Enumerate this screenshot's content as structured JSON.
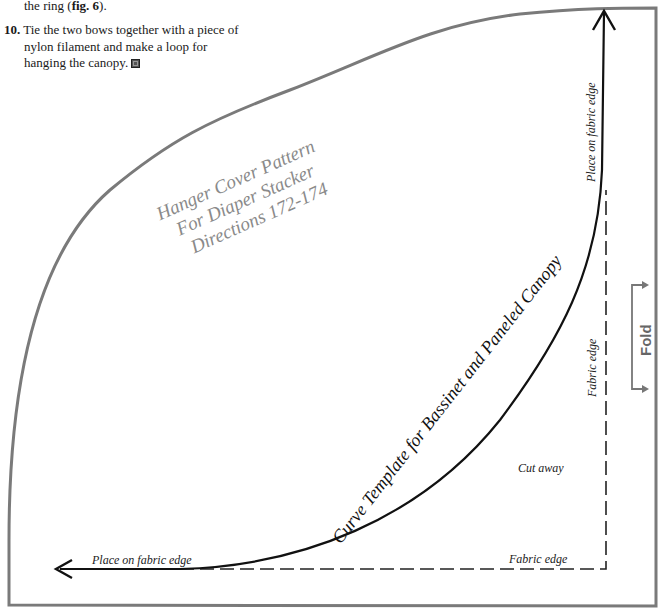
{
  "instructions": {
    "continuation_line": "the ring (",
    "continuation_fig": "fig. 6",
    "continuation_end": ").",
    "step_10": {
      "number": "10.",
      "lines": [
        "Tie the two bows together with a piece of",
        "nylon filament and make a loop for",
        "hanging the canopy."
      ],
      "end_mark": "end-of-section-square-icon"
    }
  },
  "pattern": {
    "hanger_title": {
      "lines": [
        "Hanger Cover Pattern",
        "For Diaper Stacker",
        "Directions 172-174"
      ]
    },
    "curve_title": "Curve Template for Bassinet and Paneled Canopy",
    "labels": {
      "place_on_fabric_edge_vertical": "Place on fabric edge",
      "place_on_fabric_edge_horizontal": "Place on fabric edge",
      "fabric_edge_vertical": "Fabric edge",
      "fabric_edge_horizontal": "Fabric edge",
      "cut_away": "Cut away",
      "fold": "Fold"
    },
    "colors": {
      "outline_gray": "#777777",
      "curve_black": "#111111",
      "hanger_text_gray": "#8a8a8a",
      "fold_gray": "#666666"
    }
  }
}
